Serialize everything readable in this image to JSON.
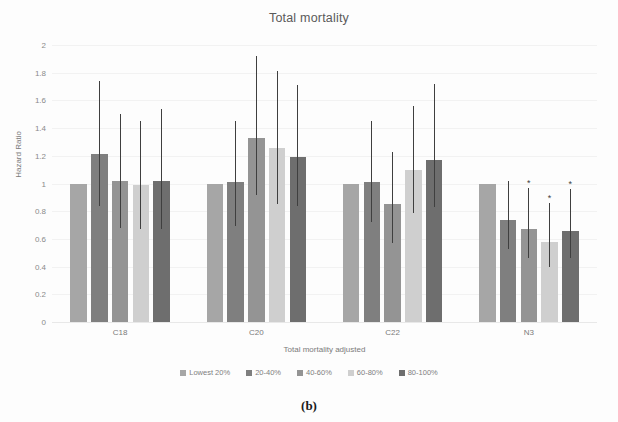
{
  "figure": {
    "caption": "(b)"
  },
  "chart_data": {
    "type": "bar",
    "title": "Total mortality",
    "xlabel": "Total mortality adjusted",
    "ylabel": "Hazard Ratio",
    "ylim": [
      0,
      2
    ],
    "ytick_step": 0.2,
    "yticks": [
      "2",
      "1.8",
      "1.6",
      "1.4",
      "1.2",
      "1",
      "0.8",
      "0.6",
      "0.4",
      "0.2",
      "0"
    ],
    "grid": true,
    "legend_position": "bottom",
    "categories": [
      "C18",
      "C20",
      "C22",
      "N3"
    ],
    "series": [
      {
        "name": "Lowest 20%",
        "color": "#a6a6a6",
        "values": [
          1.0,
          1.0,
          1.0,
          1.0
        ],
        "ci_low": [
          null,
          null,
          null,
          null
        ],
        "ci_high": [
          null,
          null,
          null,
          null
        ],
        "significant": [
          false,
          false,
          false,
          false
        ]
      },
      {
        "name": "20-40%",
        "color": "#7f7f7f",
        "values": [
          1.21,
          1.01,
          1.01,
          0.74
        ],
        "ci_low": [
          0.84,
          0.69,
          0.72,
          0.53
        ],
        "ci_high": [
          1.74,
          1.45,
          1.45,
          1.02
        ],
        "significant": [
          false,
          false,
          false,
          false
        ]
      },
      {
        "name": "40-60%",
        "color": "#949494",
        "values": [
          1.02,
          1.33,
          0.85,
          0.67
        ],
        "ci_low": [
          0.68,
          0.92,
          0.57,
          0.46
        ],
        "ci_high": [
          1.5,
          1.92,
          1.23,
          0.97
        ],
        "significant": [
          false,
          false,
          false,
          true
        ]
      },
      {
        "name": "60-80%",
        "color": "#cfcfcf",
        "values": [
          0.99,
          1.26,
          1.1,
          0.58
        ],
        "ci_low": [
          0.67,
          0.85,
          0.79,
          0.4
        ],
        "ci_high": [
          1.45,
          1.81,
          1.56,
          0.86
        ],
        "significant": [
          false,
          false,
          false,
          true
        ]
      },
      {
        "name": "80-100%",
        "color": "#6e6e6e",
        "values": [
          1.02,
          1.19,
          1.17,
          0.66
        ],
        "ci_low": [
          0.67,
          0.84,
          0.83,
          0.46
        ],
        "ci_high": [
          1.54,
          1.71,
          1.72,
          0.96
        ],
        "significant": [
          false,
          false,
          false,
          true
        ]
      }
    ],
    "annotations": {
      "significance_marker": "*"
    }
  }
}
